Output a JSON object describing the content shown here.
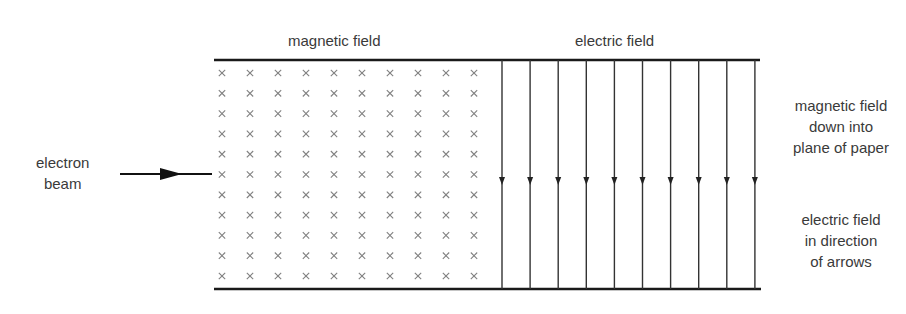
{
  "labels": {
    "magnetic_field_title": "magnetic field",
    "electric_field_title": "electric field",
    "electron_beam": [
      "electron",
      "beam"
    ],
    "magnetic_note": [
      "magnetic field",
      "down into",
      "plane of paper"
    ],
    "electric_note": [
      "electric field",
      "in direction",
      "of arrows"
    ]
  },
  "grid": {
    "symbol": "×",
    "columns": 10,
    "rows": 11
  },
  "electric_field_lines": {
    "count": 10,
    "direction": "down"
  },
  "colors": {
    "line": "#1a1a1a",
    "cross": "#777777",
    "text": "#3a3a3a"
  }
}
